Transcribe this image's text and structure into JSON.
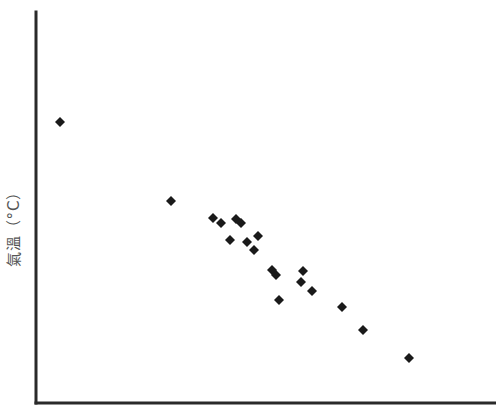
{
  "chart_data": {
    "type": "scatter",
    "title": "",
    "xlabel": "",
    "ylabel": "氣溫（°C）",
    "grid": false,
    "legend": null,
    "ticks": "none",
    "marker": "diamond",
    "marker_color": "#1a1a1a",
    "axis_color": "#2a2a2a",
    "units_note": "No tick labels shown; values are relative positions in plot pixels (x from y-axis, y upward from x-axis).",
    "xlim": [
      0,
      460
    ],
    "ylim": [
      0,
      391
    ],
    "points": [
      {
        "x": 24,
        "y": 281
      },
      {
        "x": 135,
        "y": 202
      },
      {
        "x": 177,
        "y": 185
      },
      {
        "x": 185,
        "y": 180
      },
      {
        "x": 200,
        "y": 184
      },
      {
        "x": 205,
        "y": 180
      },
      {
        "x": 194,
        "y": 163
      },
      {
        "x": 211,
        "y": 161
      },
      {
        "x": 222,
        "y": 167
      },
      {
        "x": 218,
        "y": 153
      },
      {
        "x": 236,
        "y": 133
      },
      {
        "x": 240,
        "y": 128
      },
      {
        "x": 267,
        "y": 132
      },
      {
        "x": 265,
        "y": 121
      },
      {
        "x": 276,
        "y": 112
      },
      {
        "x": 243,
        "y": 103
      },
      {
        "x": 306,
        "y": 96
      },
      {
        "x": 327,
        "y": 73
      },
      {
        "x": 373,
        "y": 45
      }
    ]
  },
  "layout": {
    "origin_x": 36,
    "origin_y": 403,
    "axis_top": 12,
    "axis_right": 496,
    "axis_width": 3,
    "marker_half": 5
  }
}
